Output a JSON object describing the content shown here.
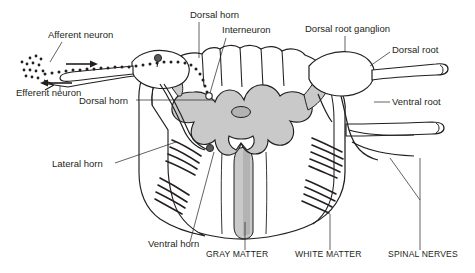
{
  "figure": {
    "colors": {
      "gray_matter": "#c9c9c9",
      "gray_matter_dark": "#b3b3b3",
      "white_matter": "#ffffff",
      "outline": "#231f20",
      "label_text": "#231f20",
      "background": "#ffffff"
    }
  },
  "labels": [
    {
      "id": "afferent-neuron",
      "text": "Afferent neuron",
      "x": 48,
      "y": 38,
      "anchor": "start"
    },
    {
      "id": "efferent-neuron",
      "text": "Efferent neuron",
      "x": 16,
      "y": 96,
      "anchor": "start"
    },
    {
      "id": "dorsal-horn-left",
      "text": "Dorsal horn",
      "x": 79,
      "y": 104,
      "anchor": "start"
    },
    {
      "id": "dorsal-horn-top",
      "text": "Dorsal horn",
      "x": 190,
      "y": 18,
      "anchor": "start"
    },
    {
      "id": "interneuron",
      "text": "Interneuron",
      "x": 222,
      "y": 33,
      "anchor": "start"
    },
    {
      "id": "dorsal-root-ganglion",
      "text": "Dorsal root ganglion",
      "x": 305,
      "y": 32,
      "anchor": "start"
    },
    {
      "id": "dorsal-root",
      "text": "Dorsal root",
      "x": 392,
      "y": 53,
      "anchor": "start"
    },
    {
      "id": "ventral-root",
      "text": "Ventral root",
      "x": 392,
      "y": 105,
      "anchor": "start"
    },
    {
      "id": "lateral-horn",
      "text": "Lateral horn",
      "x": 52,
      "y": 167,
      "anchor": "start"
    },
    {
      "id": "ventral-horn",
      "text": "Ventral horn",
      "x": 148,
      "y": 247,
      "anchor": "start"
    },
    {
      "id": "gray-matter",
      "text": "GRAY MATTER",
      "x": 206,
      "y": 257,
      "anchor": "start",
      "caps": true
    },
    {
      "id": "white-matter",
      "text": "WHITE MATTER",
      "x": 295,
      "y": 257,
      "anchor": "start",
      "caps": true
    },
    {
      "id": "spinal-nerves",
      "text": "SPINAL NERVES",
      "x": 388,
      "y": 257,
      "anchor": "start",
      "caps": true
    }
  ]
}
